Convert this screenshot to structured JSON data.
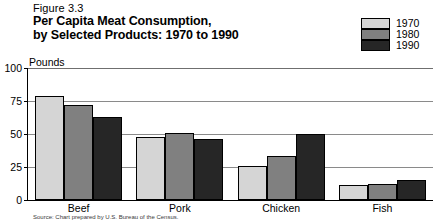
{
  "figure": {
    "number": "Figure 3.3",
    "title_line1": "Per Capita Meat Consumption,",
    "title_line2": "by Selected Products:  1970 to 1990",
    "axis_unit": "Pounds",
    "source": "Source: Chart prepared by U.S. Bureau of the Census."
  },
  "legend": {
    "items": [
      {
        "label": "1970",
        "color": "#d5d5d5"
      },
      {
        "label": "1980",
        "color": "#808080"
      },
      {
        "label": "1990",
        "color": "#262626"
      }
    ]
  },
  "chart_data": {
    "type": "bar",
    "title": "Per Capita Meat Consumption, by Selected Products:  1970 to 1990",
    "xlabel": "",
    "ylabel": "Pounds",
    "ylim": [
      0,
      100
    ],
    "yticks": [
      "0",
      "25",
      "50",
      "75",
      "100"
    ],
    "ytick_values": [
      0,
      25,
      50,
      75,
      100
    ],
    "grid": true,
    "legend_position": "top-right",
    "categories": [
      "Beef",
      "Pork",
      "Chicken",
      "Fish"
    ],
    "series": [
      {
        "name": "1970",
        "color": "#d5d5d5",
        "values": [
          79,
          48,
          26,
          11
        ]
      },
      {
        "name": "1980",
        "color": "#808080",
        "values": [
          72,
          51,
          33,
          12
        ]
      },
      {
        "name": "1990",
        "color": "#262626",
        "values": [
          63,
          46,
          50,
          15
        ]
      }
    ]
  }
}
